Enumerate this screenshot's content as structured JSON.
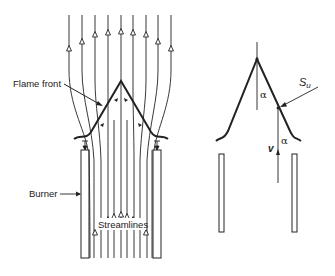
{
  "diagram": {
    "type": "bunsen-flame-schematic",
    "colors": {
      "ink": "#222222",
      "background": "#ffffff"
    },
    "left_panel": {
      "labels": {
        "flame_front": "Flame front",
        "burner": "Burner",
        "streamlines": "Streamlines"
      },
      "flame_apex": [
        121,
        81
      ],
      "flame_left_end": [
        74,
        139
      ],
      "flame_right_end": [
        168,
        139
      ],
      "burner_tubes": [
        {
          "x": 81,
          "y": 150,
          "w": 8,
          "h": 108
        },
        {
          "x": 153,
          "y": 150,
          "w": 8,
          "h": 108
        }
      ],
      "upper_streamlines": [
        {
          "x_top": 69,
          "arrow_y": 48
        },
        {
          "x_top": 82,
          "arrow_y": 41
        },
        {
          "x_top": 95,
          "arrow_y": 34
        },
        {
          "x_top": 108,
          "arrow_y": 32
        },
        {
          "x_top": 121,
          "arrow_y": 31
        },
        {
          "x_top": 133,
          "arrow_y": 32
        },
        {
          "x_top": 146,
          "arrow_y": 34
        },
        {
          "x_top": 158,
          "arrow_y": 41
        },
        {
          "x_top": 171,
          "arrow_y": 48
        }
      ],
      "lower_streamlines": [
        {
          "x": 95,
          "arrow_y": 232
        },
        {
          "x": 101,
          "arrow_y": 224
        },
        {
          "x": 108,
          "arrow_y": 219
        },
        {
          "x": 114,
          "arrow_y": 216
        },
        {
          "x": 121,
          "arrow_y": 214
        },
        {
          "x": 127,
          "arrow_y": 216
        },
        {
          "x": 133,
          "arrow_y": 219
        },
        {
          "x": 140,
          "arrow_y": 224
        },
        {
          "x": 146,
          "arrow_y": 232
        }
      ]
    },
    "right_panel": {
      "labels": {
        "alpha_top": "α",
        "alpha_bottom": "α",
        "su": "S",
        "su_sub": "u",
        "v": "v"
      },
      "flame_apex": [
        257,
        59
      ],
      "flame_left_end": [
        216,
        141
      ],
      "flame_right_end": [
        300,
        141
      ],
      "contact_point": [
        278,
        108
      ],
      "burner_tubes": [
        {
          "x": 219,
          "y": 154,
          "w": 5,
          "h": 78
        },
        {
          "x": 292,
          "y": 154,
          "w": 5,
          "h": 78
        }
      ]
    }
  }
}
